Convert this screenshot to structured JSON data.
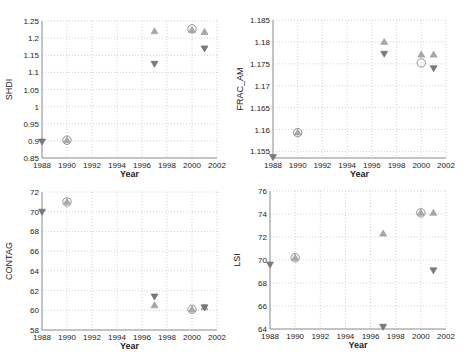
{
  "colors": {
    "circle": "#909090",
    "up": "#a8a8a8",
    "down": "#7a7a7a",
    "grid": "#c8c8c8",
    "axis": "#888888",
    "text": "#222222"
  },
  "chart_data": [
    {
      "type": "scatter",
      "title": "",
      "xlabel": "Year",
      "ylabel": "SHDI",
      "xlim": [
        1988,
        2002
      ],
      "ylim": [
        0.85,
        1.25
      ],
      "xticks": [
        "1988",
        "1990",
        "1992",
        "1994",
        "1996",
        "1998",
        "2000",
        "2002"
      ],
      "yticks": [
        "0.85",
        "0.9",
        "0.95",
        "1",
        "1.05",
        "1.1",
        "1.15",
        "1.2",
        "1.25"
      ],
      "grid": true,
      "rect": {
        "left": 42,
        "top": 21,
        "right": 217,
        "bottom": 158
      },
      "series": [
        {
          "name": "circle",
          "marker": "o",
          "x": [
            1990,
            2000
          ],
          "y": [
            0.902,
            1.227
          ]
        },
        {
          "name": "up-triangle",
          "marker": "^",
          "x": [
            1990,
            1997,
            2000,
            2001
          ],
          "y": [
            0.902,
            1.22,
            1.224,
            1.218
          ]
        },
        {
          "name": "down-triangle",
          "marker": "v",
          "x": [
            1988,
            1997,
            2001
          ],
          "y": [
            0.898,
            1.125,
            1.17
          ]
        }
      ]
    },
    {
      "type": "scatter",
      "title": "",
      "xlabel": "Year",
      "ylabel": "FRAC_AM",
      "xlim": [
        1988,
        2002
      ],
      "ylim": [
        1.1535,
        1.185
      ],
      "xticks": [
        "1988",
        "1990",
        "1992",
        "1994",
        "1996",
        "1998",
        "2000",
        "2002"
      ],
      "yticks": [
        "1.155",
        "1.16",
        "1.165",
        "1.17",
        "1.175",
        "1.18",
        "1.185"
      ],
      "ytick_values": [
        1.155,
        1.16,
        1.165,
        1.17,
        1.175,
        1.18,
        1.185
      ],
      "grid": true,
      "rect": {
        "left": 273,
        "top": 20,
        "right": 446,
        "bottom": 158
      },
      "series": [
        {
          "name": "circle",
          "marker": "o",
          "x": [
            1990,
            2000
          ],
          "y": [
            1.1593,
            1.1752
          ]
        },
        {
          "name": "up-triangle",
          "marker": "^",
          "x": [
            1990,
            1997,
            2000,
            2001
          ],
          "y": [
            1.1593,
            1.18,
            1.1771,
            1.1771
          ]
        },
        {
          "name": "down-triangle",
          "marker": "v",
          "x": [
            1988,
            1997,
            2001
          ],
          "y": [
            1.1537,
            1.1773,
            1.174
          ]
        }
      ]
    },
    {
      "type": "scatter",
      "title": "",
      "xlabel": "Year",
      "ylabel": "CONTAG",
      "xlim": [
        1988,
        2002
      ],
      "ylim": [
        58,
        72
      ],
      "xticks": [
        "1988",
        "1990",
        "1992",
        "1994",
        "1996",
        "1998",
        "2000",
        "2002"
      ],
      "yticks": [
        "58",
        "60",
        "62",
        "64",
        "66",
        "68",
        "70",
        "72"
      ],
      "grid": true,
      "rect": {
        "left": 42,
        "top": 192,
        "right": 217,
        "bottom": 330
      },
      "series": [
        {
          "name": "circle",
          "marker": "o",
          "x": [
            1990,
            2000
          ],
          "y": [
            71.0,
            60.1
          ]
        },
        {
          "name": "up-triangle",
          "marker": "^",
          "x": [
            1990,
            1997,
            2000,
            2001
          ],
          "y": [
            71.0,
            60.5,
            60.1,
            60.3
          ]
        },
        {
          "name": "down-triangle",
          "marker": "v",
          "x": [
            1988,
            1997,
            2001
          ],
          "y": [
            70.0,
            61.4,
            60.3
          ]
        }
      ]
    },
    {
      "type": "scatter",
      "title": "",
      "xlabel": "Year",
      "ylabel": "LSI",
      "xlim": [
        1988,
        2002
      ],
      "ylim": [
        64,
        76
      ],
      "xticks": [
        "1988",
        "1990",
        "1992",
        "1994",
        "1996",
        "1998",
        "2000",
        "2002"
      ],
      "yticks": [
        "64",
        "66",
        "68",
        "70",
        "72",
        "74",
        "76"
      ],
      "grid": true,
      "rect": {
        "left": 270,
        "top": 191,
        "right": 446,
        "bottom": 329
      },
      "series": [
        {
          "name": "circle",
          "marker": "o",
          "x": [
            1990,
            2000
          ],
          "y": [
            70.2,
            74.1
          ]
        },
        {
          "name": "up-triangle",
          "marker": "^",
          "x": [
            1990,
            1997,
            2000,
            2001
          ],
          "y": [
            70.2,
            72.3,
            74.1,
            74.1
          ]
        },
        {
          "name": "down-triangle",
          "marker": "v",
          "x": [
            1988,
            1997,
            2001
          ],
          "y": [
            69.6,
            64.2,
            69.1
          ]
        }
      ]
    }
  ]
}
